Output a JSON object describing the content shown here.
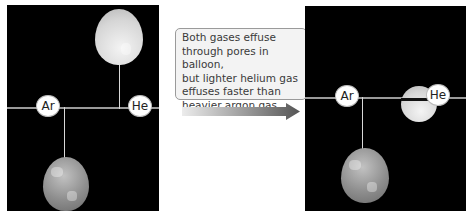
{
  "figure": {
    "left_panel": {
      "labels": {
        "argon": "Ar",
        "helium": "He"
      },
      "helium_balloon_state": "inflated",
      "argon_balloon_state": "inflated"
    },
    "caption_box": {
      "text": "Both gases effuse through pores in balloon, but lighter helium gas effuses faster than heavier argon gas",
      "lines": [
        "Both gases effuse",
        "through pores in balloon,",
        "but lighter helium gas",
        "effuses faster than",
        "heavier argon gas"
      ]
    },
    "arrow": {
      "direction": "right",
      "gradient": [
        "#e8e8e8",
        "#555555"
      ]
    },
    "right_panel": {
      "labels": {
        "argon": "Ar",
        "helium": "He"
      },
      "helium_balloon_state": "deflated",
      "argon_balloon_state": "inflated"
    },
    "colors": {
      "panel_bg": "#000000",
      "text_box_bg": "#f3f3f3",
      "text_color": "#3a3a3a"
    }
  }
}
